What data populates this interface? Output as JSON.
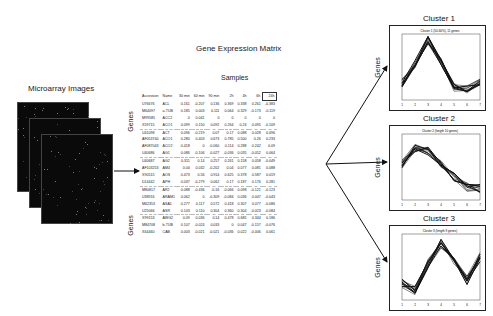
{
  "microarray": {
    "label": "Microarray Images"
  },
  "matrix": {
    "title": "Gene Expression Matrix",
    "samples_label": "Samples",
    "genes_label_top": "Genes",
    "genes_label_bottom": "Genes",
    "columns": [
      "Accession",
      "Name",
      "30 min",
      "60 min",
      "90 min",
      "2h",
      "4h",
      "6h",
      "24h"
    ],
    "rows": [
      [
        "U76676",
        "ACL",
        "0.161",
        "-0.207",
        "0.136",
        "0.369",
        "0.338",
        "0.261",
        "-0.383"
      ],
      [
        "M64097",
        "a-TUB",
        "0.185",
        "0.003",
        "0.111",
        "0.064",
        "0.329",
        "-0.173",
        "-0.119"
      ],
      [
        "M99585",
        "ACC2",
        "0",
        "0.041",
        "0",
        "0",
        "0",
        "0",
        "0"
      ],
      [
        "X59715",
        "ACO1",
        "0.099",
        "0.150",
        "0.092",
        "0.264",
        "0.24",
        "0.095",
        "-0.109"
      ],
      [
        "U41098",
        "ACT",
        "0.096",
        "-0.219",
        "0.07",
        "0.17",
        "0.088",
        "0.028",
        "0.096"
      ],
      [
        "AF053740",
        "ACO1",
        "0.280",
        "0.403",
        "0.673",
        "0.785",
        "0.500",
        "0.26",
        "0.233"
      ],
      [
        "AF087043",
        "ACO2",
        "0.418",
        "0",
        "-0.060",
        "0.114",
        "0.288",
        "0.242",
        "0.09"
      ],
      [
        "U40686",
        "AG1",
        "0.086",
        "-0.106",
        "-0.027",
        "-0.036",
        "0.035",
        "-0.052",
        "0.064"
      ],
      [
        "U40687",
        "AG2",
        "0.311",
        "0.14",
        "0.257",
        "0.261",
        "0.158",
        "0.058",
        "-0.049"
      ],
      [
        "AF103253",
        "AM4",
        "0.04",
        "0.032",
        "-0.202",
        "0.04",
        "0.077",
        "0.081",
        "0.088"
      ],
      [
        "X90515",
        "AOS",
        "0.473",
        "0.56",
        "0.914",
        "0.625",
        "0.378",
        "0.587",
        "0.019"
      ],
      [
        "D14442",
        "APH",
        "0.037",
        "-0.279",
        "0.062",
        "0.17",
        "0.187",
        "0.176",
        "0.281"
      ],
      [
        "M80817",
        "AR2",
        "0.088",
        "-0.436",
        "-0.16",
        "-0.066",
        "0.098",
        "-0.121",
        "-0.123"
      ],
      [
        "U38916",
        "ARAM1",
        "0.062",
        "0",
        "-0.309",
        "-0.084",
        "0.036",
        "0.047",
        "-0.043"
      ],
      [
        "M62353",
        "ASA1",
        "0.277",
        "0.117",
        "0.572",
        "0.418",
        "0.307",
        "0.077",
        "-0.086"
      ],
      [
        "U25066",
        "ASR",
        "0.103",
        "0.110",
        "0.304",
        "0.360",
        "0.304",
        "-0.023",
        "-0.084"
      ],
      [
        "X99153",
        "AWG2",
        "0.09",
        "0.036",
        "0.14",
        "0.478",
        "0.685",
        "0.344",
        "0.186"
      ],
      [
        "M84708",
        "b-TUB",
        "0.107",
        "-0.024",
        "0.033",
        "0",
        "0.047",
        "-0.157",
        "-0.076"
      ],
      [
        "X64460",
        "CAB",
        "0.003",
        "-0.021",
        "-0.021",
        "-0.036",
        "0.022",
        "-0.006",
        "0.061"
      ]
    ]
  },
  "clusters": [
    {
      "title": "Cluster 1",
      "subtitle": "Cluster 1 (50-60%), 11 genes",
      "axis_label": "Genes"
    },
    {
      "title": "Cluster 2",
      "subtitle": "Cluster 2 (length 10 genes)",
      "axis_label": "Genes"
    },
    {
      "title": "Cluster 3",
      "subtitle": "Cluster 3 (length 9 genes)",
      "axis_label": "Genes"
    }
  ],
  "colors": {
    "line": "#111111",
    "microarray_bg": "#0a0a0a",
    "background": "#ffffff"
  }
}
